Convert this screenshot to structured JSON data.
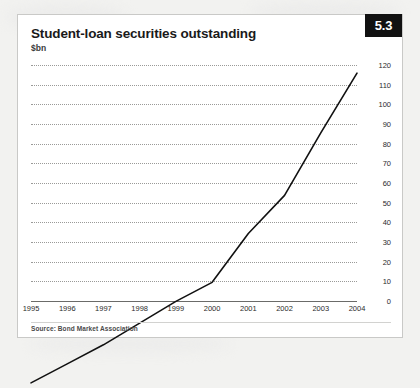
{
  "card": {
    "title": "Student-loan securities outstanding",
    "subtitle": "$bn",
    "badge": "5.3",
    "source": "Source: Bond Market Association",
    "accent_color": "#111111",
    "line_color": "#111111",
    "grid_color": "#9a9a98",
    "card_background": "#ffffff",
    "page_background": "#f2f2f0"
  },
  "chart_data": {
    "type": "line",
    "title": "Student-loan securities outstanding",
    "subtitle": "$bn",
    "xlabel": "",
    "ylabel": "$bn",
    "categories": [
      "1995",
      "1996",
      "1997",
      "1998",
      "1999",
      "2000",
      "2001",
      "2002",
      "2003",
      "2004"
    ],
    "values": [
      3,
      10,
      17,
      25,
      33,
      40,
      58,
      72,
      95,
      117
    ],
    "series": [
      {
        "name": "Student-loan securities outstanding",
        "values": [
          3,
          10,
          17,
          25,
          33,
          40,
          58,
          72,
          95,
          117
        ]
      }
    ],
    "ylim": [
      0,
      120
    ],
    "yticks": [
      0,
      10,
      20,
      30,
      40,
      50,
      60,
      70,
      80,
      90,
      100,
      110,
      120
    ],
    "ytick_labels": [
      "0",
      "10",
      "20",
      "30",
      "40",
      "50",
      "60",
      "70",
      "80",
      "90",
      "100",
      "110",
      "120"
    ],
    "y_axis_position": "right",
    "grid": true,
    "grid_style": "dotted-horizontal",
    "legend": false,
    "legend_position": "none",
    "source": "Source: Bond Market Association"
  }
}
